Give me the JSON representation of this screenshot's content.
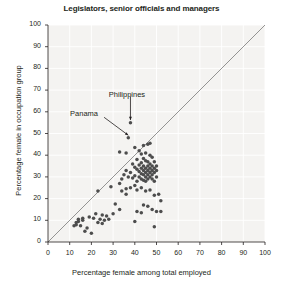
{
  "chart_data": {
    "type": "scatter",
    "title": "Legislators, senior officials and managers",
    "xlabel": "Percentage female among total employed",
    "ylabel": "Percentage female in occupation group",
    "xlim": [
      0,
      100
    ],
    "ylim": [
      0,
      100
    ],
    "xticks": [
      0,
      10,
      20,
      30,
      40,
      50,
      60,
      70,
      80,
      90,
      100
    ],
    "yticks": [
      0,
      10,
      20,
      30,
      40,
      50,
      60,
      70,
      80,
      90,
      100
    ],
    "grid": true,
    "legend": "none",
    "point_color": "#4d4d4d",
    "reference_line": {
      "label": "y = x diagonal",
      "from": [
        0,
        0
      ],
      "to": [
        100,
        100
      ],
      "color": "#7a7a7a"
    },
    "annotations": [
      {
        "label": "Philippines",
        "point": [
          38,
          55
        ],
        "text_xy": [
          40,
          66
        ],
        "arrow": "down"
      },
      {
        "label": "Panama",
        "point": [
          37,
          48
        ],
        "text_xy": [
          24,
          57
        ],
        "arrow": "down-right"
      }
    ],
    "points": [
      [
        38,
        55
      ],
      [
        37,
        48
      ],
      [
        33,
        41.5
      ],
      [
        36,
        41
      ],
      [
        40,
        43.5
      ],
      [
        44,
        44.5
      ],
      [
        47,
        45.5
      ],
      [
        46,
        45
      ],
      [
        42,
        42
      ],
      [
        45,
        41
      ],
      [
        43,
        40.5
      ],
      [
        47,
        40
      ],
      [
        48,
        39
      ],
      [
        44,
        38.5
      ],
      [
        41,
        38
      ],
      [
        45,
        37.5
      ],
      [
        46,
        37
      ],
      [
        49,
        37
      ],
      [
        43,
        36.5
      ],
      [
        47,
        36
      ],
      [
        39,
        36
      ],
      [
        42,
        35.5
      ],
      [
        44,
        35
      ],
      [
        46,
        35
      ],
      [
        48,
        35
      ],
      [
        50,
        35
      ],
      [
        40,
        34.5
      ],
      [
        43,
        34
      ],
      [
        45,
        34
      ],
      [
        47,
        34
      ],
      [
        49,
        34
      ],
      [
        41,
        33.5
      ],
      [
        44,
        33
      ],
      [
        46,
        33
      ],
      [
        48,
        33
      ],
      [
        50,
        33
      ],
      [
        42,
        32.5
      ],
      [
        45,
        32
      ],
      [
        47,
        32
      ],
      [
        49,
        32
      ],
      [
        43,
        31.5
      ],
      [
        44,
        31
      ],
      [
        46,
        31
      ],
      [
        48,
        31
      ],
      [
        40,
        30.5
      ],
      [
        42,
        30
      ],
      [
        45,
        30
      ],
      [
        47,
        30
      ],
      [
        50,
        30
      ],
      [
        39,
        29.5
      ],
      [
        43,
        29
      ],
      [
        46,
        29
      ],
      [
        48,
        29
      ],
      [
        44,
        28.5
      ],
      [
        41,
        28
      ],
      [
        45,
        28
      ],
      [
        49,
        28
      ],
      [
        38,
        32
      ],
      [
        36,
        33
      ],
      [
        35,
        31
      ],
      [
        37,
        30
      ],
      [
        34,
        29
      ],
      [
        33,
        27
      ],
      [
        40,
        26
      ],
      [
        38,
        25
      ],
      [
        36,
        24.5
      ],
      [
        43,
        25
      ],
      [
        41,
        24
      ],
      [
        47,
        24
      ],
      [
        45,
        23.5
      ],
      [
        34,
        23.5
      ],
      [
        36,
        22
      ],
      [
        29,
        25.5
      ],
      [
        23,
        23.5
      ],
      [
        31,
        17.5
      ],
      [
        33,
        15
      ],
      [
        44,
        17
      ],
      [
        46,
        16.5
      ],
      [
        48,
        15
      ],
      [
        50,
        14
      ],
      [
        52,
        14
      ],
      [
        51,
        22
      ],
      [
        49,
        21.5
      ],
      [
        52,
        19
      ],
      [
        43,
        13.5
      ],
      [
        41,
        14
      ],
      [
        40,
        9.5
      ],
      [
        49,
        7
      ],
      [
        22,
        13
      ],
      [
        25,
        12.5
      ],
      [
        27,
        12
      ],
      [
        19,
        11.5
      ],
      [
        21,
        11
      ],
      [
        24,
        10.5
      ],
      [
        26,
        10
      ],
      [
        16,
        10
      ],
      [
        14,
        9.5
      ],
      [
        13,
        9
      ],
      [
        13,
        8
      ],
      [
        15,
        7.5
      ],
      [
        23,
        9
      ],
      [
        25,
        8.5
      ],
      [
        17,
        5
      ],
      [
        20,
        4
      ],
      [
        18,
        6.5
      ],
      [
        12,
        7.5
      ],
      [
        14,
        10.5
      ],
      [
        16,
        11
      ],
      [
        28,
        10.5
      ],
      [
        30,
        13
      ]
    ]
  }
}
